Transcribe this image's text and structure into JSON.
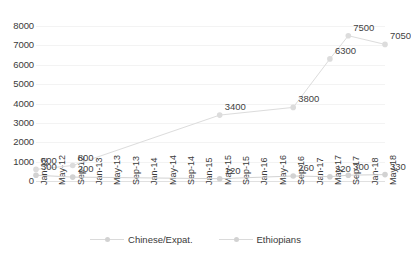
{
  "chart_data": {
    "type": "line",
    "title": "",
    "xlabel": "",
    "ylabel": "",
    "ylim": [
      0,
      8000
    ],
    "ytick_values": [
      8000,
      7000,
      6000,
      5000,
      4000,
      3000,
      2000,
      1000,
      0
    ],
    "grid": true,
    "legend_position": "bottom",
    "categories": [
      "Jan-12",
      "May-12",
      "Sep-12",
      "Jan-13",
      "May-13",
      "Sep-13",
      "Jan-14",
      "May-14",
      "Sep-14",
      "Jan-15",
      "May-15",
      "Sep-15",
      "Jan-16",
      "May-16",
      "Sep-16",
      "Jan-17",
      "May-17",
      "Sep-17",
      "Jan-18",
      "May-18"
    ],
    "series": [
      {
        "name": "Chinese/Expat.",
        "color": "#d2d2d2",
        "points": [
          {
            "x": "Jan-12",
            "y": 300,
            "label": "300"
          },
          {
            "x": "Sep-12",
            "y": 200,
            "label": "200"
          },
          {
            "x": "May-15",
            "y": 120,
            "label": "120"
          },
          {
            "x": "Sep-16",
            "y": 260,
            "label": "260"
          },
          {
            "x": "May-17",
            "y": 220,
            "label": "220"
          },
          {
            "x": "Sep-17",
            "y": 300,
            "label": "300"
          },
          {
            "x": "May-18",
            "y": 330,
            "label": "330"
          }
        ]
      },
      {
        "name": "Ethiopians",
        "color": "#dcdcdc",
        "points": [
          {
            "x": "Jan-12",
            "y": 600,
            "label": "600"
          },
          {
            "x": "Sep-12",
            "y": 800,
            "label": "800"
          },
          {
            "x": "May-15",
            "y": 3400,
            "label": "3400"
          },
          {
            "x": "Sep-16",
            "y": 3800,
            "label": "3800"
          },
          {
            "x": "May-17",
            "y": 6300,
            "label": "6300"
          },
          {
            "x": "Sep-17",
            "y": 7500,
            "label": "7500"
          },
          {
            "x": "May-18",
            "y": 7050,
            "label": "7050"
          }
        ]
      }
    ]
  },
  "legend": {
    "items": [
      {
        "label": "Chinese/Expat."
      },
      {
        "label": "Ethiopians"
      }
    ]
  }
}
